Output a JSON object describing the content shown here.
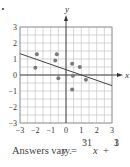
{
  "chart_data": {
    "type": "scatter",
    "title": "",
    "xlabel": "x",
    "ylabel": "y",
    "xlim": [
      -3,
      3
    ],
    "ylim": [
      -3,
      3
    ],
    "grid": true,
    "minor_grid_step": 0.5,
    "x_ticks": [
      "-3",
      "-2",
      "-1",
      "0",
      "1",
      "2",
      "3"
    ],
    "y_ticks": [
      "-3",
      "-2",
      "-1",
      "0",
      "1",
      "2",
      "3"
    ],
    "points": [
      {
        "x": -1.9,
        "y": 1.3
      },
      {
        "x": -2.0,
        "y": 0.45
      },
      {
        "x": -0.6,
        "y": 1.3
      },
      {
        "x": -0.7,
        "y": 0.9
      },
      {
        "x": -0.5,
        "y": -0.2
      },
      {
        "x": 0.4,
        "y": 0.7
      },
      {
        "x": 0.9,
        "y": 0.5
      },
      {
        "x": 0.45,
        "y": -0.05
      },
      {
        "x": 0.4,
        "y": -0.9
      },
      {
        "x": 1.3,
        "y": -0.3
      }
    ],
    "trend_line": {
      "slope": -0.3333,
      "intercept": 0.3333,
      "x_range": [
        -3,
        3
      ]
    },
    "annotation": "Answers vary. y = -1/3 x + 1/3"
  },
  "caption": {
    "prefix": "Answers vary.",
    "y_var": "y",
    "equals": "=",
    "slope_num": "⁻1",
    "slope_den": "3",
    "x_var": "x",
    "plus": "+",
    "int_num": "1",
    "int_den": "3"
  },
  "axis_labels": {
    "x": "x",
    "y": "y"
  },
  "colors": {
    "grid": "#bdbdbd",
    "axis": "#333333",
    "point": "#7a7a7a",
    "line": "#444444"
  }
}
